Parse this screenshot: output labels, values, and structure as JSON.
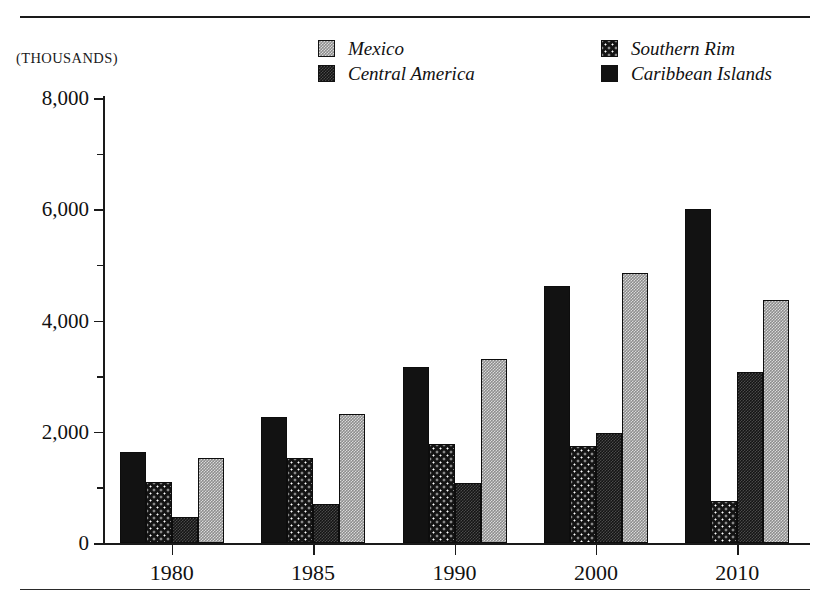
{
  "page": {
    "clipped_header_text": "",
    "units_caption": "(THOUSANDS)"
  },
  "legend": {
    "items": [
      {
        "label": "Mexico",
        "key": "mexico",
        "swatch": "light-grey-checker-swatch"
      },
      {
        "label": "Central America",
        "key": "central",
        "swatch": "dark-stipple-swatch"
      },
      {
        "label": "Southern Rim",
        "key": "southern",
        "swatch": "dark-dotted-swatch"
      },
      {
        "label": "Caribbean Islands",
        "key": "caribbean",
        "swatch": "solid-black-swatch"
      }
    ]
  },
  "axes": {
    "y_major_labels": [
      "8,000",
      "6,000",
      "4,000",
      "2,000",
      "0"
    ],
    "y_major_values": [
      8000,
      6000,
      4000,
      2000,
      0
    ],
    "y_minor_values": [
      7000,
      5000,
      3000,
      1000
    ],
    "x_labels": [
      "1980",
      "1985",
      "1990",
      "2000",
      "2010"
    ]
  },
  "chart_data": {
    "type": "bar",
    "title": "",
    "xlabel": "",
    "ylabel": "(THOUSANDS)",
    "ylim": [
      0,
      8000
    ],
    "ytick_values": [
      0,
      1000,
      2000,
      3000,
      4000,
      5000,
      6000,
      7000,
      8000
    ],
    "ytick_labels": [
      "0",
      "",
      "2,000",
      "",
      "4,000",
      "",
      "6,000",
      "",
      "8,000"
    ],
    "grid": false,
    "legend_position": "top-center",
    "bar_order_in_group": [
      "Caribbean Islands",
      "Southern Rim",
      "Central America",
      "Mexico"
    ],
    "categories": [
      "1980",
      "1985",
      "1990",
      "2000",
      "2010"
    ],
    "series": [
      {
        "name": "Caribbean Islands",
        "key": "caribbean",
        "values": [
          1640,
          2270,
          3170,
          4620,
          6000
        ]
      },
      {
        "name": "Southern Rim",
        "key": "southern",
        "values": [
          1100,
          1530,
          1780,
          1750,
          750
        ]
      },
      {
        "name": "Central America",
        "key": "central",
        "values": [
          470,
          700,
          1070,
          1970,
          3070
        ]
      },
      {
        "name": "Mexico",
        "key": "mexico",
        "values": [
          1520,
          2320,
          3310,
          4850,
          4370
        ]
      }
    ]
  }
}
